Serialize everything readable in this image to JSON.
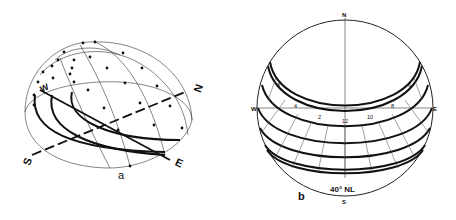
{
  "figure_a": {
    "label": "a",
    "compass": {
      "south": "S",
      "east": "E",
      "north": "N",
      "west": "W"
    },
    "description": "Perspective view of the sky hemisphere showing sun paths with hour dots"
  },
  "figure_b": {
    "label": "b",
    "caption": "40° NL",
    "compass": {
      "north": "N",
      "south": "S",
      "east": "E",
      "west": "W"
    },
    "hour_labels": [
      "4",
      "6",
      "8",
      "10",
      "12",
      "2",
      "4",
      "6",
      "8"
    ],
    "hour_labels_positioned": {
      "left_upper": "8",
      "left_mid": "6",
      "left_w": "4",
      "left_low": "2",
      "center": "12",
      "right_low": "10",
      "right_e": "8",
      "right_mid": "6",
      "right_upper": "4"
    },
    "description": "Stereographic sun-path diagram for 40 degrees north latitude"
  }
}
